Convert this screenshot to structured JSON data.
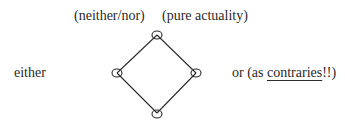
{
  "labels": {
    "top_left": "(neither/nor)",
    "top_right": "(pure actuality)",
    "left": "either",
    "right_prefix": "or (as ",
    "right_underlined": "contraries",
    "right_suffix": "!!)"
  },
  "diagram": {
    "shape": "diamond",
    "vertices": {
      "top": [
        157,
        35
      ],
      "left": [
        117,
        73
      ],
      "right": [
        196,
        73
      ],
      "bottom": [
        157,
        113
      ]
    },
    "stroke_color": "#2a2a2a",
    "node_marker": "ellipse"
  }
}
